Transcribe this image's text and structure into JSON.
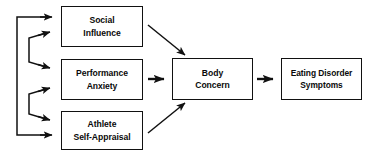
{
  "diagram": {
    "type": "flowchart",
    "background_color": "#ffffff",
    "stroke_color": "#111111",
    "nodes": [
      {
        "id": "social",
        "label": "Social Influence",
        "lines": [
          "Social",
          "Influence"
        ],
        "shape": "rectangle"
      },
      {
        "id": "performance",
        "label": "Performance Anxiety",
        "lines": [
          "Performance",
          "Anxiety"
        ],
        "shape": "rectangle"
      },
      {
        "id": "athlete",
        "label": "Athlete Self-Appraisal",
        "lines": [
          "Athlete",
          "Self-Appraisal"
        ],
        "shape": "rectangle"
      },
      {
        "id": "body",
        "label": "Body Concern",
        "lines": [
          "Body",
          "Concern"
        ],
        "shape": "rectangle"
      },
      {
        "id": "eating",
        "label": "Eating Disorder Symptoms",
        "lines": [
          "Eating Disorder",
          "Symptoms"
        ],
        "shape": "rectangle"
      }
    ],
    "edges": [
      {
        "from": "social",
        "to": "body",
        "style": "diagonal-down-right"
      },
      {
        "from": "performance",
        "to": "body",
        "style": "horizontal-right"
      },
      {
        "from": "athlete",
        "to": "body",
        "style": "diagonal-up-right"
      },
      {
        "from": "body",
        "to": "eating",
        "style": "horizontal-right"
      },
      {
        "from": "athlete",
        "to": "social",
        "style": "feedback-loop-outer"
      },
      {
        "from": "performance",
        "to": "social",
        "style": "feedback-bracket-upper"
      },
      {
        "from": "social",
        "to": "performance",
        "style": "feedback-bracket-upper"
      },
      {
        "from": "athlete",
        "to": "performance",
        "style": "feedback-bracket-lower"
      },
      {
        "from": "performance",
        "to": "athlete",
        "style": "feedback-bracket-lower"
      },
      {
        "from": "social",
        "to": "athlete",
        "style": "feedback-loop-outer"
      }
    ]
  }
}
